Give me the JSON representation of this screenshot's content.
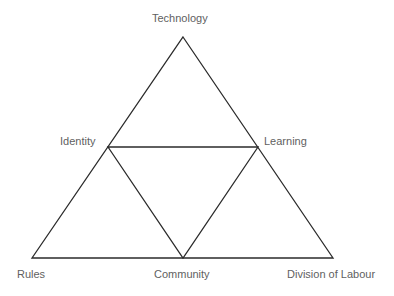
{
  "diagram": {
    "type": "activity-system-triangle",
    "line_color": "#2b2b2b",
    "label_color": "#5f5f5f",
    "nodes": {
      "top": {
        "label": "Technology"
      },
      "middle_left": {
        "label": "Identity"
      },
      "middle_right": {
        "label": "Learning"
      },
      "bottom_left": {
        "label": "Rules"
      },
      "bottom_middle": {
        "label": "Community"
      },
      "bottom_right": {
        "label": "Division of Labour"
      }
    }
  }
}
